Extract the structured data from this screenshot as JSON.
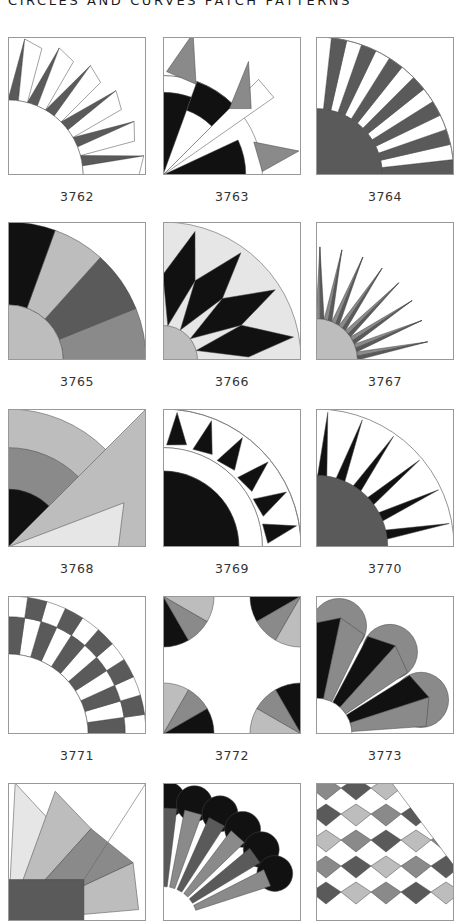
{
  "page": {
    "title": "CIRCLES AND CURVES PATCH PATTERNS"
  },
  "colors": {
    "black": "#111111",
    "dark": "#5a5a5a",
    "mid": "#8a8a8a",
    "light": "#bdbdbd",
    "pale": "#e6e6e6",
    "border": "#999999"
  },
  "patterns": [
    {
      "id": "3762",
      "label": "3762"
    },
    {
      "id": "3763",
      "label": "3763"
    },
    {
      "id": "3764",
      "label": "3764"
    },
    {
      "id": "3765",
      "label": "3765"
    },
    {
      "id": "3766",
      "label": "3766"
    },
    {
      "id": "3767",
      "label": "3767"
    },
    {
      "id": "3768",
      "label": "3768"
    },
    {
      "id": "3769",
      "label": "3769"
    },
    {
      "id": "3770",
      "label": "3770"
    },
    {
      "id": "3771",
      "label": "3771"
    },
    {
      "id": "3772",
      "label": "3772"
    },
    {
      "id": "3773",
      "label": "3773"
    },
    {
      "id": "3774",
      "label": ""
    },
    {
      "id": "3775",
      "label": ""
    },
    {
      "id": "3776",
      "label": ""
    }
  ]
}
